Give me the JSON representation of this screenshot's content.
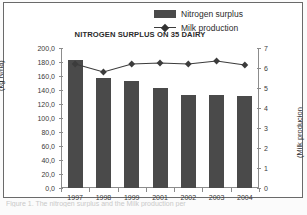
{
  "figure": {
    "title": "NITROGEN SURPLUS ON 35 DAIRY",
    "caption": "Figure 1. The nitrogen surplus and the Milk production per"
  },
  "legend": {
    "items": [
      {
        "label": "Nitrogen surplus",
        "marker": "bar-swatch",
        "color": "#4a4a4a"
      },
      {
        "label": "Milk production",
        "marker": "line-diamond",
        "color": "#3c3c3c"
      }
    ]
  },
  "axes": {
    "left": {
      "title": "(kg N/ha)",
      "ticks": [
        "200,0",
        "180,0",
        "160,0",
        "140,0",
        "120,0",
        "100,0",
        "80,0",
        "60,0",
        "40,0",
        "20,0",
        "0,0"
      ]
    },
    "right": {
      "title": "(Milk producion",
      "ticks": [
        "7",
        "6",
        "5",
        "4",
        "3",
        "2",
        "1",
        "0"
      ]
    },
    "bottom": {
      "ticks": [
        "1997",
        "1998",
        "1999",
        "2001",
        "2002",
        "2003",
        "2004"
      ]
    }
  },
  "chart_data": {
    "type": "bar",
    "title": "NITROGEN SURPLUS ON 35 DAIRY",
    "xlabel": "",
    "ylabel": "(kg N/ha)",
    "y2label": "(Milk producion",
    "categories": [
      "1997",
      "1998",
      "1999",
      "2001",
      "2002",
      "2003",
      "2004"
    ],
    "ylim": [
      0,
      200
    ],
    "y2lim": [
      0,
      7
    ],
    "grid": false,
    "legend_position": "top-right",
    "series": [
      {
        "name": "Nitrogen surplus",
        "type": "bar",
        "axis": "left",
        "color": "#4a4a4a",
        "values": [
          183,
          157,
          153,
          143,
          133,
          133,
          132
        ]
      },
      {
        "name": "Milk production",
        "type": "line",
        "axis": "right",
        "color": "#3c3c3c",
        "marker": "diamond",
        "values": [
          6.2,
          5.8,
          6.2,
          6.25,
          6.2,
          6.35,
          6.15
        ]
      }
    ]
  }
}
